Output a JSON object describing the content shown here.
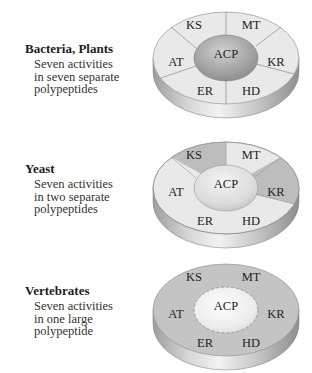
{
  "panels": [
    {
      "organism": "Bacteria, Plants",
      "description": [
        "Seven activities",
        "in seven separate",
        "polypeptides"
      ],
      "arrangement": "seven-separate",
      "domains": {
        "center": "ACP",
        "KS": "KS",
        "MT": "MT",
        "KR": "KR",
        "HD": "HD",
        "ER": "ER",
        "AT": "AT"
      }
    },
    {
      "organism": "Yeast",
      "description": [
        "Seven activities",
        "in two separate",
        "polypeptides"
      ],
      "arrangement": "two-separate",
      "domains": {
        "center": "ACP",
        "KS": "KS",
        "MT": "MT",
        "KR": "KR",
        "HD": "HD",
        "ER": "ER",
        "AT": "AT"
      }
    },
    {
      "organism": "Vertebrates",
      "description": [
        "Seven activities",
        "in one large",
        "polypeptide"
      ],
      "arrangement": "one-large",
      "domains": {
        "center": "ACP",
        "KS": "KS",
        "MT": "MT",
        "KR": "KR",
        "HD": "HD",
        "ER": "ER",
        "AT": "AT"
      }
    }
  ],
  "colors": {
    "light_segment": "#e8e8e8",
    "dark_segment": "#bdbdbd",
    "vertebrate_face": "#c4c4c4",
    "acp_dark": "#9a9a9a",
    "acp_light": "#eeeeee",
    "side_mid": "#d6d6d6"
  }
}
